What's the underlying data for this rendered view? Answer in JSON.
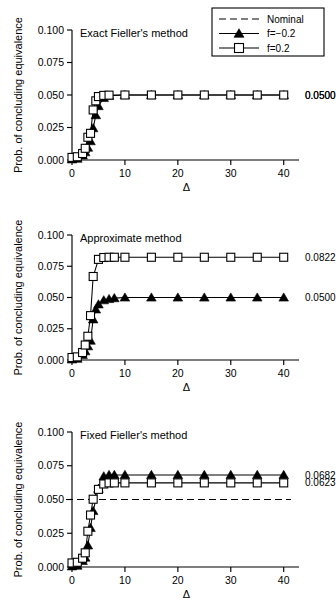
{
  "figure": {
    "ylabel": "Prob. of concluding equivalence",
    "xlabel": "Δ",
    "ytick_labels": [
      "0.000",
      "0.025",
      "0.050",
      "0.075",
      "0.100"
    ],
    "ytick_values": [
      0.0,
      0.025,
      0.05,
      0.075,
      0.1
    ],
    "xtick_labels": [
      "0",
      "10",
      "20",
      "30",
      "40"
    ],
    "xtick_values": [
      0,
      10,
      20,
      30,
      40
    ]
  },
  "legend": {
    "position": "top-right-panel-1",
    "items": [
      {
        "label": "Nominal",
        "style": "dashed-line",
        "marker": "none"
      },
      {
        "label": "f=−0.2",
        "style": "solid-line",
        "marker": "filled-triangle"
      },
      {
        "label": "f=0.2",
        "style": "solid-line",
        "marker": "open-square"
      }
    ]
  },
  "chart_data": [
    {
      "type": "line",
      "title": "Exact Fieller's method",
      "xlabel": "Δ",
      "ylabel": "Prob. of concluding equivalence",
      "xlim": [
        0,
        41
      ],
      "ylim": [
        0,
        0.1
      ],
      "grid": false,
      "legend": "shared-top-right",
      "nominal": 0.05,
      "nominal_drawn": false,
      "series": [
        {
          "name": "f=−0.2",
          "marker": "filled-triangle",
          "end_label": "0.0500",
          "x": [
            0,
            1,
            2,
            2.5,
            3,
            3.5,
            4,
            4.5,
            5,
            6,
            7,
            10,
            15,
            20,
            25,
            30,
            35,
            40
          ],
          "values": [
            0.0005,
            0.001,
            0.0035,
            0.006,
            0.0095,
            0.0145,
            0.0245,
            0.0345,
            0.0415,
            0.0478,
            0.0495,
            0.05,
            0.05,
            0.05,
            0.05,
            0.05,
            0.05,
            0.05
          ]
        },
        {
          "name": "f=0.2",
          "marker": "open-square",
          "end_label": "0.0500",
          "x": [
            0,
            1,
            2,
            2.5,
            3,
            3.5,
            4,
            4.5,
            5,
            6,
            7,
            10,
            15,
            20,
            25,
            30,
            35,
            40
          ],
          "values": [
            0.002,
            0.0025,
            0.005,
            0.009,
            0.0175,
            0.0205,
            0.0385,
            0.0455,
            0.0488,
            0.0497,
            0.0499,
            0.05,
            0.05,
            0.05,
            0.05,
            0.05,
            0.05,
            0.05
          ]
        }
      ]
    },
    {
      "type": "line",
      "title": "Approximate method",
      "xlabel": "Δ",
      "ylabel": "Prob. of concluding equivalence",
      "xlim": [
        0,
        41
      ],
      "ylim": [
        0,
        0.1
      ],
      "grid": false,
      "nominal": 0.05,
      "nominal_drawn": false,
      "series": [
        {
          "name": "f=−0.2",
          "marker": "filled-triangle",
          "end_label": "0.0500",
          "x": [
            0,
            1,
            2,
            2.5,
            3,
            3.5,
            4,
            4.5,
            5,
            6,
            7,
            8,
            10,
            15,
            20,
            25,
            30,
            35,
            40
          ],
          "values": [
            0.0005,
            0.001,
            0.004,
            0.007,
            0.011,
            0.0155,
            0.0325,
            0.0405,
            0.0445,
            0.0478,
            0.0488,
            0.0495,
            0.05,
            0.05,
            0.05,
            0.05,
            0.05,
            0.05,
            0.05
          ]
        },
        {
          "name": "f=0.2",
          "marker": "open-square",
          "end_label": "0.0822",
          "x": [
            0,
            1,
            2,
            2.5,
            3,
            3.5,
            4,
            5,
            6,
            7,
            8,
            10,
            15,
            20,
            25,
            30,
            35,
            40
          ],
          "values": [
            0.002,
            0.0025,
            0.006,
            0.012,
            0.019,
            0.0355,
            0.0668,
            0.0805,
            0.082,
            0.0822,
            0.0822,
            0.0822,
            0.0822,
            0.0822,
            0.0822,
            0.0822,
            0.0822,
            0.0822
          ]
        }
      ]
    },
    {
      "type": "line",
      "title": "Fixed Fieller's method",
      "xlabel": "Δ",
      "ylabel": "Prob. of concluding equivalence",
      "xlim": [
        0,
        41
      ],
      "ylim": [
        0,
        0.1
      ],
      "grid": false,
      "nominal": 0.05,
      "nominal_drawn": true,
      "series": [
        {
          "name": "f=−0.2",
          "marker": "filled-triangle",
          "end_label": "0.0682",
          "x": [
            0,
            1,
            2,
            2.5,
            3,
            3.5,
            4,
            5,
            6,
            7,
            8,
            10,
            15,
            20,
            25,
            30,
            35,
            40
          ],
          "values": [
            0.0005,
            0.001,
            0.0045,
            0.007,
            0.016,
            0.029,
            0.0415,
            0.058,
            0.0672,
            0.0682,
            0.0682,
            0.0682,
            0.0682,
            0.0682,
            0.0682,
            0.0682,
            0.0682,
            0.0682
          ]
        },
        {
          "name": "f=0.2",
          "marker": "open-square",
          "end_label": "0.0623",
          "x": [
            0,
            1,
            2,
            2.5,
            3,
            3.5,
            4,
            5,
            6,
            7,
            8,
            10,
            15,
            20,
            25,
            30,
            35,
            40
          ],
          "values": [
            0.003,
            0.0035,
            0.0065,
            0.0105,
            0.0265,
            0.0385,
            0.0502,
            0.0575,
            0.0615,
            0.0623,
            0.0623,
            0.0623,
            0.0623,
            0.0623,
            0.0623,
            0.0623,
            0.0623,
            0.0623
          ]
        }
      ]
    }
  ]
}
